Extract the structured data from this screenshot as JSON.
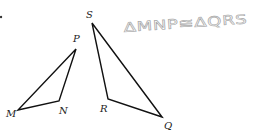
{
  "diagram": {
    "statement": "ΔMNP≅ΔQRS",
    "statement_color": "#a8a8a8",
    "line_color": "#111111",
    "triangles": [
      {
        "name": "MNP",
        "vertices": [
          {
            "label": "M",
            "x": 18,
            "y": 110,
            "lx": 6,
            "ly": 117
          },
          {
            "label": "N",
            "x": 59,
            "y": 101,
            "lx": 59,
            "ly": 114
          },
          {
            "label": "P",
            "x": 76,
            "y": 49,
            "lx": 73,
            "ly": 42
          }
        ]
      },
      {
        "name": "QRS",
        "vertices": [
          {
            "label": "Q",
            "x": 162,
            "y": 117,
            "lx": 164,
            "ly": 129
          },
          {
            "label": "R",
            "x": 108,
            "y": 99,
            "lx": 100,
            "ly": 112
          },
          {
            "label": "S",
            "x": 92,
            "y": 23,
            "lx": 86,
            "ly": 18
          }
        ]
      }
    ]
  }
}
